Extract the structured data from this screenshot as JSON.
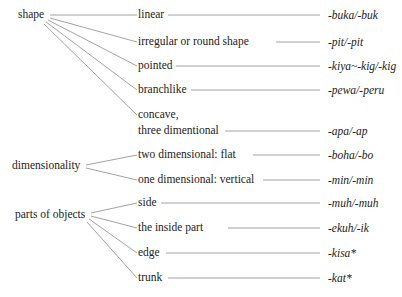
{
  "diagram": {
    "categories": [
      {
        "label": "shape",
        "children": [
          {
            "label": "linear",
            "suffix": "-buka/-buk"
          },
          {
            "label": "irregular or round shape",
            "suffix": "-pit/-pit"
          },
          {
            "label": "pointed",
            "suffix": "-kiya~-kig/-kig"
          },
          {
            "label": "branchlike",
            "suffix": "-pewa/-peru"
          },
          {
            "label_line1": "concave,",
            "label_line2": "three dimentional",
            "suffix": "-apa/-ap"
          }
        ]
      },
      {
        "label": "dimensionality",
        "children": [
          {
            "label": "two dimensional: flat",
            "suffix": "-boha/-bo"
          },
          {
            "label": "one dimensional: vertical",
            "suffix": "-min/-min"
          }
        ]
      },
      {
        "label": "parts of objects",
        "children": [
          {
            "label": "side",
            "suffix": "-muh/-muh"
          },
          {
            "label": "the inside part",
            "suffix": "-ekuh/-ik"
          },
          {
            "label": "edge",
            "suffix": "-kisa*"
          },
          {
            "label": "trunk",
            "suffix": "-kat*"
          }
        ]
      }
    ]
  }
}
